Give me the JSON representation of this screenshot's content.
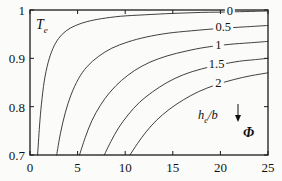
{
  "chart_data": {
    "type": "line",
    "title": "",
    "xlabel": "Φ",
    "ylabel": "T_e",
    "xlim": [
      0,
      25
    ],
    "ylim": [
      0.7,
      1.0
    ],
    "xticks": [
      "0",
      "5",
      "10",
      "15",
      "20",
      "25"
    ],
    "xtick_values": [
      0,
      5,
      10,
      15,
      20,
      25
    ],
    "yticks": [
      "0.7",
      "0.8",
      "0.9",
      "1"
    ],
    "ytick_values": [
      0.7,
      0.8,
      0.9,
      1.0
    ],
    "grid": false,
    "legend_position": "inline-right",
    "legend_title": "h_e/b",
    "annotation": "h_e/b",
    "annotation_arrow": "down-arrow",
    "series": [
      {
        "name": "0",
        "label": "0",
        "x": [
          0.8,
          1.0,
          1.2,
          1.5,
          1.9,
          2.4,
          3.0,
          3.8,
          4.8,
          6.0,
          7.5,
          9.5,
          12.0,
          15.0,
          18.0,
          21.0,
          25.0
        ],
        "y": [
          0.7,
          0.76,
          0.805,
          0.853,
          0.891,
          0.92,
          0.941,
          0.957,
          0.968,
          0.976,
          0.982,
          0.987,
          0.99,
          0.993,
          0.995,
          0.996,
          0.998
        ]
      },
      {
        "name": "0.5",
        "label": "0.5",
        "x": [
          2.8,
          3.2,
          3.7,
          4.3,
          5.1,
          6.0,
          7.2,
          8.6,
          10.3,
          12.2,
          14.5,
          17.0,
          20.0,
          22.5,
          25.0
        ],
        "y": [
          0.7,
          0.745,
          0.787,
          0.824,
          0.858,
          0.883,
          0.904,
          0.921,
          0.934,
          0.944,
          0.952,
          0.957,
          0.962,
          0.965,
          0.968
        ]
      },
      {
        "name": "1",
        "label": "1",
        "x": [
          5.2,
          5.8,
          6.5,
          7.4,
          8.4,
          9.6,
          11.0,
          12.6,
          14.4,
          16.4,
          18.5,
          21.0,
          23.0,
          25.0
        ],
        "y": [
          0.7,
          0.736,
          0.771,
          0.803,
          0.83,
          0.854,
          0.875,
          0.892,
          0.905,
          0.915,
          0.923,
          0.929,
          0.932,
          0.935
        ]
      },
      {
        "name": "1.5",
        "label": "1.5",
        "x": [
          7.8,
          8.5,
          9.3,
          10.3,
          11.5,
          12.9,
          14.4,
          16.1,
          18.0,
          20.0,
          22.0,
          23.5,
          25.0
        ],
        "y": [
          0.7,
          0.728,
          0.756,
          0.783,
          0.809,
          0.831,
          0.85,
          0.866,
          0.878,
          0.887,
          0.894,
          0.897,
          0.9
        ]
      },
      {
        "name": "2",
        "label": "2",
        "x": [
          10.5,
          11.3,
          12.2,
          13.3,
          14.6,
          16.1,
          17.7,
          19.5,
          21.4,
          23.2,
          25.0
        ],
        "y": [
          0.7,
          0.724,
          0.748,
          0.772,
          0.794,
          0.814,
          0.831,
          0.845,
          0.856,
          0.864,
          0.87
        ]
      }
    ]
  },
  "style": {
    "curve_color": "#2a2a2a",
    "axis_color": "#1a1a1a",
    "text_color": "#111111",
    "background": "#fbfbf9"
  }
}
